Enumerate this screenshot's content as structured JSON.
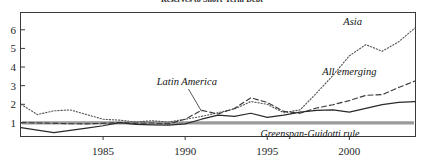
{
  "chart_data": {
    "type": "line",
    "title": "Reserves to Short-Term Debt",
    "xlabel": "",
    "ylabel": "",
    "xlim": [
      1980,
      2004
    ],
    "ylim": [
      0.3,
      6.9
    ],
    "grid": false,
    "legend_position": "inline-annotations",
    "x_ticks": [
      "1985",
      "1990",
      "1995",
      "2000"
    ],
    "x_tick_values": [
      1985,
      1990,
      1995,
      2000
    ],
    "y_ticks": [
      "1",
      "2",
      "3",
      "4",
      "5",
      "6"
    ],
    "y_tick_values": [
      1,
      2,
      3,
      4,
      5,
      6
    ],
    "reference_line": {
      "label": "Greenspan-Guidotti rule",
      "value": 1,
      "color": "#9a9a9a"
    },
    "x": [
      1980,
      1981,
      1982,
      1983,
      1984,
      1985,
      1986,
      1987,
      1988,
      1989,
      1990,
      1991,
      1992,
      1993,
      1994,
      1995,
      1996,
      1997,
      1998,
      1999,
      2000,
      2001,
      2002,
      2003,
      2004
    ],
    "series": [
      {
        "name": "Asia",
        "style": "dotted",
        "color": "#555555",
        "label_x": 2000.2,
        "label_y": 6.25,
        "values": [
          2.0,
          1.45,
          1.65,
          1.7,
          1.45,
          1.2,
          1.15,
          1.05,
          1.12,
          1.05,
          1.2,
          1.35,
          1.55,
          1.75,
          2.15,
          2.0,
          1.55,
          1.7,
          2.6,
          3.55,
          4.6,
          5.2,
          4.85,
          5.35,
          6.1
        ]
      },
      {
        "name": "All emerging",
        "style": "dashed",
        "color": "#3a3a3a",
        "label_x": 2000.0,
        "label_y": 3.55,
        "values": [
          1.02,
          1.0,
          0.98,
          0.96,
          0.95,
          0.98,
          1.02,
          0.98,
          1.0,
          0.95,
          1.2,
          1.68,
          1.48,
          1.78,
          2.35,
          2.1,
          1.62,
          1.52,
          1.8,
          1.98,
          2.2,
          2.48,
          2.52,
          2.9,
          3.25
        ]
      },
      {
        "name": "Latin America",
        "style": "solid",
        "color": "#2a2a2a",
        "label_x": 1990.1,
        "label_y": 3.05,
        "values": [
          0.75,
          0.62,
          0.48,
          0.6,
          0.72,
          0.85,
          1.02,
          0.92,
          0.9,
          0.88,
          0.95,
          1.2,
          1.42,
          1.35,
          1.52,
          1.3,
          1.42,
          1.58,
          1.68,
          1.7,
          1.58,
          1.78,
          1.98,
          2.1,
          2.15
        ]
      }
    ],
    "annotations": [
      {
        "text": "Latin America",
        "leader_from": [
          1990.2,
          2.82
        ],
        "leader_to": [
          1991.0,
          1.62
        ]
      },
      {
        "text": "Asia",
        "leader": false
      },
      {
        "text": "All emerging",
        "leader": false
      }
    ]
  }
}
